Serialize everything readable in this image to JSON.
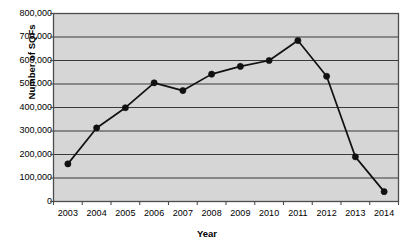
{
  "chart_data": {
    "type": "line",
    "title": "",
    "xlabel": "Year",
    "ylabel": "Number of SQFs",
    "categories": [
      "2003",
      "2004",
      "2005",
      "2006",
      "2007",
      "2008",
      "2009",
      "2010",
      "2011",
      "2012",
      "2013",
      "2014"
    ],
    "values": [
      160000,
      313000,
      399000,
      505000,
      472000,
      542000,
      575000,
      600000,
      685000,
      533000,
      190000,
      42000
    ],
    "series": [
      {
        "name": "Number of SQFs",
        "values": [
          160000,
          313000,
          399000,
          505000,
          472000,
          542000,
          575000,
          600000,
          685000,
          533000,
          190000,
          42000
        ]
      }
    ],
    "ylim": [
      0,
      800000
    ],
    "ytick_labels": [
      "0",
      "100,000",
      "200,000",
      "300,000",
      "400,000",
      "500,000",
      "600,000",
      "700,000",
      "800,000"
    ],
    "ytick_values": [
      0,
      100000,
      200000,
      300000,
      400000,
      500000,
      600000,
      700000,
      800000
    ],
    "xtick_labels": [
      "2003",
      "2004",
      "2005",
      "2006",
      "2007",
      "2008",
      "2009",
      "2010",
      "2011",
      "2012",
      "2013",
      "2014"
    ],
    "grid": "horizontal",
    "legend": "none",
    "marker": "filled-circle",
    "colors": {
      "plot_background": "#d6d6d6",
      "plot_border": "#4d4d4d",
      "gridline": "#3a3a3a",
      "line": "#111111",
      "marker": "#111111",
      "text": "#000000",
      "page_background": "#ffffff"
    }
  }
}
